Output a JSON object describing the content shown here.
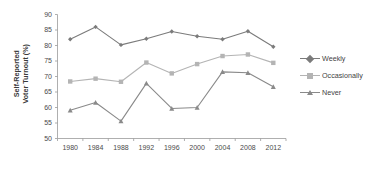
{
  "chart_data": {
    "type": "line",
    "title": "",
    "xlabel": "",
    "ylabel": "Self-Reported Voter Turnout (%)",
    "ylabel_line1": "Self-Reported",
    "ylabel_line2": "Voter Turnout (%)",
    "categories": [
      "1980",
      "1984",
      "1988",
      "1992",
      "1996",
      "2000",
      "2004",
      "2008",
      "2012"
    ],
    "ylim": [
      50,
      90
    ],
    "yticks": [
      "90",
      "85",
      "80",
      "75",
      "70",
      "65",
      "60",
      "55",
      "50"
    ],
    "ytick_values": [
      90,
      85,
      80,
      75,
      70,
      65,
      60,
      55,
      50
    ],
    "grid": false,
    "legend_position": "right",
    "series": [
      {
        "name": "Weekly",
        "marker": "diamond",
        "color": "#7b7b7b",
        "values": [
          82.0,
          86.0,
          80.2,
          82.2,
          84.5,
          83.0,
          82.0,
          84.6,
          79.6
        ]
      },
      {
        "name": "Occasionally",
        "marker": "square",
        "color": "#b4b4b4",
        "values": [
          68.4,
          69.3,
          68.3,
          74.5,
          71.0,
          74.0,
          76.6,
          77.1,
          74.4
        ]
      },
      {
        "name": "Never",
        "marker": "triangle",
        "color": "#8a8a8a",
        "values": [
          59.1,
          61.6,
          55.6,
          67.8,
          59.7,
          60.0,
          71.5,
          71.2,
          66.7
        ]
      }
    ]
  },
  "legend": {
    "items": [
      {
        "label": "Weekly"
      },
      {
        "label": "Occasionally"
      },
      {
        "label": "Never"
      }
    ]
  },
  "colors": {
    "axis": "#9a9a9a",
    "text": "#4a4a4a",
    "weekly": "#7b7b7b",
    "occasionally": "#b4b4b4",
    "never": "#8a8a8a",
    "background": "#ffffff"
  }
}
